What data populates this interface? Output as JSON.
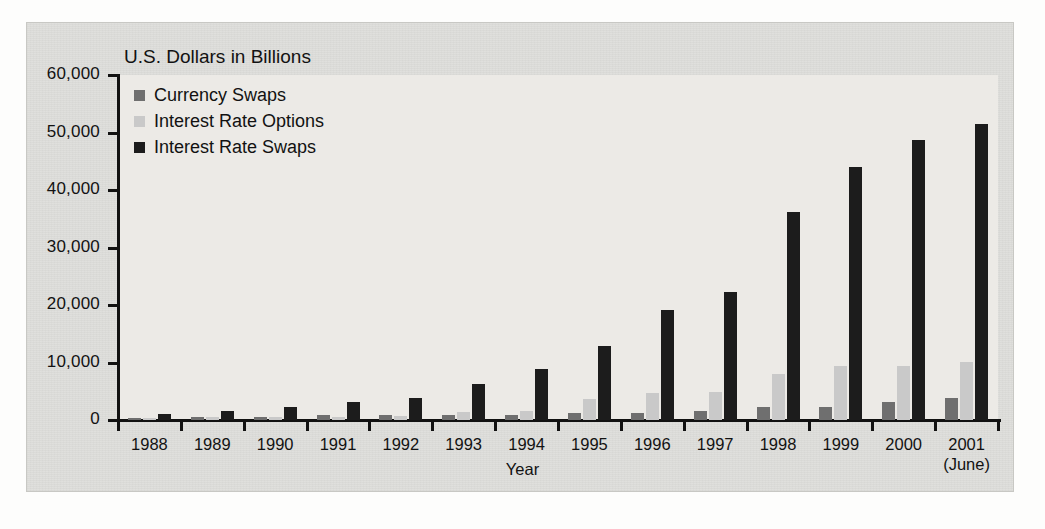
{
  "chart_data": {
    "type": "bar",
    "title": "",
    "ylabel": "U.S. Dollars in Billions",
    "xlabel": "Year",
    "ylim": [
      0,
      60000
    ],
    "ytick_labels": [
      "60,000",
      "50,000",
      "40,000",
      "30,000",
      "20,000",
      "10,000",
      "0"
    ],
    "ytick_values": [
      60000,
      50000,
      40000,
      30000,
      20000,
      10000,
      0
    ],
    "grid": false,
    "legend_position": "top-left inside plot",
    "categories": [
      "1988",
      "1989",
      "1990",
      "1991",
      "1992",
      "1993",
      "1994",
      "1995",
      "1996",
      "1997",
      "1998",
      "1999",
      "2000",
      "2001"
    ],
    "category_sublabels": [
      "",
      "",
      "",
      "",
      "",
      "",
      "",
      "",
      "",
      "",
      "",
      "",
      "",
      "(June)"
    ],
    "series": [
      {
        "name": "Currency Swaps",
        "color": "#6f6f6f",
        "values": [
          320,
          450,
          580,
          810,
          860,
          900,
          915,
          1200,
          1300,
          1585,
          2250,
          2250,
          3200,
          3800
        ]
      },
      {
        "name": "Interest Rate Options",
        "color": "#c9c9c9",
        "values": [
          330,
          540,
          560,
          577,
          635,
          1400,
          1573,
          3704,
          4723,
          4920,
          7997,
          9380,
          9476,
          10033
        ]
      },
      {
        "name": "Interest Rate Swaps",
        "color": "#1c1c1c",
        "values": [
          1010,
          1503,
          2312,
          3065,
          3851,
          6177,
          8816,
          12811,
          19171,
          22291,
          36262,
          43936,
          48768,
          51407
        ]
      }
    ]
  },
  "axes": {
    "y_axis_title": "U.S. Dollars in Billions",
    "x_axis_title": "Year"
  },
  "legend": {
    "items": [
      {
        "label": "Currency Swaps",
        "color": "#6f6f6f"
      },
      {
        "label": "Interest Rate Options",
        "color": "#c9c9c9"
      },
      {
        "label": "Interest Rate Swaps",
        "color": "#1c1c1c"
      }
    ]
  },
  "colors": {
    "page_background": "#ffffff",
    "panel_background": "#dededb",
    "plot_background": "#eceae6",
    "axis": "#111111",
    "text": "#121212"
  }
}
